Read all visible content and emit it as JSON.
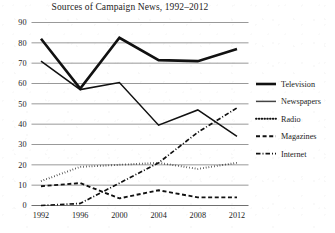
{
  "chart_data": {
    "type": "line",
    "title": "Sources of Campaign News, 1992–2012",
    "xlabel": "",
    "ylabel": "",
    "x": [
      1992,
      1996,
      2000,
      2004,
      2008,
      2012
    ],
    "xtick_labels": [
      "1992",
      "1996",
      "2000",
      "2004",
      "2008",
      "2012"
    ],
    "ytick_labels": [
      "0",
      "10",
      "20",
      "30",
      "40",
      "50",
      "60",
      "70",
      "80",
      "90"
    ],
    "yticks": [
      0,
      10,
      20,
      30,
      40,
      50,
      60,
      70,
      80,
      90
    ],
    "ylim": [
      0,
      90
    ],
    "xlim": [
      1992,
      2012
    ],
    "grid": "horizontal",
    "legend_position": "right",
    "series": [
      {
        "name": "Television",
        "style": "solid-thick",
        "color": "#111111",
        "values": [
          82,
          57.5,
          82.5,
          71.5,
          71,
          77
        ]
      },
      {
        "name": "Newspapers",
        "style": "solid-thin",
        "color": "#444444",
        "values": [
          71,
          57,
          60.5,
          39.5,
          47,
          34
        ]
      },
      {
        "name": "Radio",
        "style": "dotted",
        "color": "#111111",
        "values": [
          12,
          19,
          20,
          21,
          18,
          21
        ]
      },
      {
        "name": "Magazines",
        "style": "dashed",
        "color": "#111111",
        "values": [
          9.5,
          11,
          3.5,
          7.5,
          4,
          4
        ]
      },
      {
        "name": "Internet",
        "style": "dash-dot",
        "color": "#111111",
        "values": [
          0,
          1,
          11,
          21,
          36,
          48
        ]
      }
    ]
  },
  "legend": {
    "items": [
      {
        "label": "Television"
      },
      {
        "label": "Newspapers"
      },
      {
        "label": "Radio"
      },
      {
        "label": "Magazines"
      },
      {
        "label": "Internet"
      }
    ]
  },
  "colors": {
    "ink": "#111111",
    "grid": "#8d8d8d",
    "page": "#ffffff"
  }
}
